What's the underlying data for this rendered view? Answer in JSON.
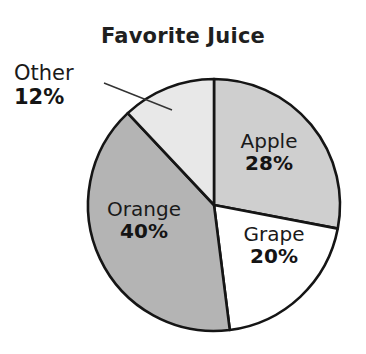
{
  "chart_data": {
    "type": "pie",
    "title": "Favorite Juice",
    "xlabel": "",
    "ylabel": "",
    "legend_position": "none",
    "grid": false,
    "unit": "%",
    "categories": [
      "Apple",
      "Grape",
      "Orange",
      "Other"
    ],
    "values": [
      28,
      20,
      40,
      12
    ],
    "slices": [
      {
        "label": "Apple",
        "value": 28,
        "value_text": "28%",
        "color": "#cfcfcf",
        "start_angle_deg": 0,
        "end_angle_deg": 100.8,
        "label_placement": "inside"
      },
      {
        "label": "Grape",
        "value": 20,
        "value_text": "20%",
        "color": "#ffffff",
        "start_angle_deg": 100.8,
        "end_angle_deg": 172.8,
        "label_placement": "inside"
      },
      {
        "label": "Orange",
        "value": 40,
        "value_text": "40%",
        "color": "#b4b4b4",
        "start_angle_deg": 172.8,
        "end_angle_deg": 316.8,
        "label_placement": "inside"
      },
      {
        "label": "Other",
        "value": 12,
        "value_text": "12%",
        "color": "#e8e8e8",
        "start_angle_deg": 316.8,
        "end_angle_deg": 360,
        "label_placement": "outside-leader"
      }
    ],
    "total": 100,
    "outline_color": "#151515",
    "leader_line_color": "#333333"
  },
  "geometry": {
    "center_x": 214,
    "center_y": 205,
    "radius": 126,
    "leader": {
      "x1": 104,
      "y1": 83,
      "x2": 172,
      "y2": 110
    }
  }
}
